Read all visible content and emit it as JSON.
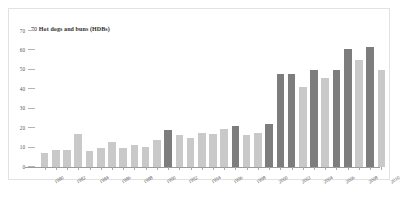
{
  "chart_data": {
    "type": "bar",
    "title": "Hot dogs and buns (HDBs)",
    "axis_max_label": "70",
    "xlabel": "",
    "ylabel": "",
    "ylim": [
      0,
      70
    ],
    "grid": false,
    "legend": "none",
    "yticks": [
      "70",
      "60",
      "50",
      "40",
      "30",
      "20",
      "10",
      "0"
    ],
    "ytick_values": [
      70,
      60,
      50,
      40,
      30,
      20,
      10,
      0
    ],
    "xtick_labels": [
      "1980",
      "1982",
      "1984",
      "1986",
      "1988",
      "1990",
      "1992",
      "1994",
      "1996",
      "1998",
      "2000",
      "2002",
      "2004",
      "2006",
      "2008",
      "2010"
    ],
    "categories": [
      "1980",
      "1981",
      "1982",
      "1983",
      "1984",
      "1985",
      "1986",
      "1987",
      "1988",
      "1989",
      "1990",
      "1991",
      "1992",
      "1993",
      "1994",
      "1995",
      "1996",
      "1997",
      "1998",
      "1999",
      "2000",
      "2001",
      "2002",
      "2003",
      "2004",
      "2005",
      "2006",
      "2007",
      "2008",
      "2009",
      "2010"
    ],
    "values": [
      7,
      9,
      9,
      17,
      8,
      10,
      13,
      10,
      11.5,
      10.5,
      14,
      19,
      16.5,
      15,
      17.5,
      17,
      19.5,
      21,
      16.5,
      17.5,
      22,
      48,
      48,
      41,
      50,
      46,
      50,
      61,
      55,
      62,
      50
    ],
    "series_colors": {
      "dark": "#7d7d7d",
      "light": "#c9c9c9"
    },
    "bar_colors": [
      "light",
      "light",
      "light",
      "light",
      "light",
      "light",
      "light",
      "light",
      "light",
      "light",
      "light",
      "dark",
      "light",
      "light",
      "light",
      "light",
      "light",
      "dark",
      "light",
      "light",
      "dark",
      "dark",
      "dark",
      "light",
      "dark",
      "light",
      "dark",
      "dark",
      "light",
      "dark",
      "light"
    ]
  },
  "caption": ""
}
